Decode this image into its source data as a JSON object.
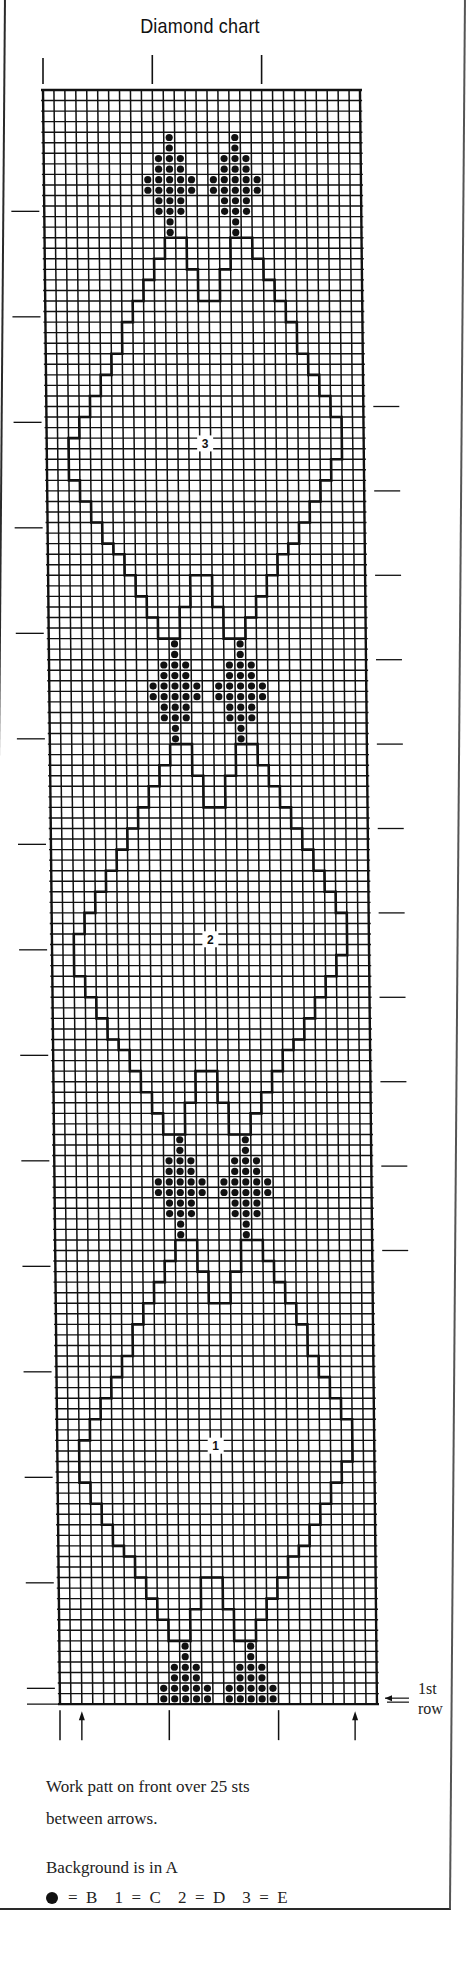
{
  "title": "Diamond chart",
  "first_row_label": [
    "1st",
    "row"
  ],
  "notes": {
    "line1": "Work patt on front over 25 sts",
    "line2": "between arrows.",
    "background": "Background is in A"
  },
  "legend": [
    {
      "symbol": "dot",
      "equals": "=",
      "value": "B"
    },
    {
      "symbol": "1",
      "equals": "=",
      "value": "C"
    },
    {
      "symbol": "2",
      "equals": "=",
      "value": "D"
    },
    {
      "symbol": "3",
      "equals": "=",
      "value": "E"
    }
  ],
  "colors": {
    "ink": "#111111",
    "paper": "#ffffff"
  },
  "chart_data": {
    "type": "table",
    "title": "Diamond chart",
    "grid": {
      "columns": 29,
      "rows": 153,
      "cell_width_px": 10.93,
      "cell_height_px": 10.55
    },
    "pattern_stitches_between_arrows": 25,
    "first_row": "bottom",
    "motif": {
      "symbol": "dot",
      "color_key": "B",
      "shape_rows_top_to_bottom": [
        [
          2
        ],
        [
          2
        ],
        [
          1,
          2,
          3
        ],
        [
          1,
          2,
          3
        ],
        [
          0,
          1,
          2,
          3,
          4
        ],
        [
          0,
          1,
          2,
          3,
          4
        ],
        [
          1,
          2,
          3
        ],
        [
          1,
          2,
          3
        ],
        [
          2
        ],
        [
          2
        ]
      ],
      "column_starts": [
        9,
        15
      ],
      "row_starts": [
        4,
        52,
        99
      ],
      "partial_bottom": {
        "row_start": 147,
        "rows_shown": 6
      }
    },
    "diamonds": [
      {
        "label": "3",
        "color_key": "E",
        "top_row": 14,
        "bottom_row": 51,
        "label_row": 33
      },
      {
        "label": "2",
        "color_key": "D",
        "top_row": 62,
        "bottom_row": 98,
        "label_row": 80
      },
      {
        "label": "1",
        "color_key": "C",
        "top_row": 109,
        "bottom_row": 146,
        "label_row": 128
      }
    ],
    "top_markers_cols": [
      0,
      10,
      20
    ],
    "bottom_markers": [
      {
        "col": 0,
        "type": "line"
      },
      {
        "col": 2,
        "type": "arrow"
      },
      {
        "col": 10,
        "type": "line"
      },
      {
        "col": 20,
        "type": "line"
      },
      {
        "col": 27,
        "type": "arrow"
      }
    ],
    "left_ticks_every_rows": 10,
    "right_ticks_rows": [
      30,
      38,
      46,
      54,
      62,
      70,
      78,
      86,
      94,
      102,
      110
    ]
  }
}
